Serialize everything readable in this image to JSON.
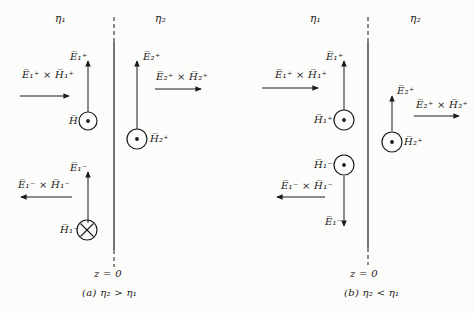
{
  "figure": {
    "background": "#fcfcfa",
    "ink": "#1a1a19"
  },
  "panel_a": {
    "region_left": "η₁",
    "region_right": "η₂",
    "boundary_label": "z = 0",
    "caption": "(a)  η₂ > η₁",
    "incident": {
      "e_label": "E̅₁⁺",
      "poynting_label": "E̅₁⁺ × H̅₁⁺",
      "h_label": "H̅",
      "h_symbol": "out-of-page",
      "e_direction": "up",
      "propagation": "right"
    },
    "reflected": {
      "e_label": "E̅₁⁻",
      "poynting_label": "E̅₁⁻ × H̅₁⁻",
      "h_label": "H̅₁⁻",
      "h_symbol": "into-page",
      "e_direction": "up",
      "propagation": "left"
    },
    "transmitted": {
      "e_label": "E̅₂⁺",
      "poynting_label": "E̅₂⁺ × H̅₂⁺",
      "h_label": "H̅₂⁺",
      "h_symbol": "out-of-page",
      "e_direction": "up",
      "propagation": "right"
    }
  },
  "panel_b": {
    "region_left": "η₁",
    "region_right": "η₂",
    "boundary_label": "z = 0",
    "caption": "(b)  η₂ < η₁",
    "incident": {
      "e_label": "E̅₁⁺",
      "poynting_label": "E̅₁⁺ × H̅₁⁺",
      "h_label": "H̅₁⁺",
      "h_symbol": "out-of-page",
      "e_direction": "up",
      "propagation": "right"
    },
    "reflected": {
      "e_label": "E̅₁⁻",
      "poynting_label": "E̅₁⁻ × H̅₁⁻",
      "h_label": "H̅₁⁻",
      "h_symbol": "out-of-page",
      "e_direction": "down",
      "propagation": "left"
    },
    "transmitted": {
      "e_label": "E̅₂⁺",
      "poynting_label": "E̅₂⁺ × H̅₂⁺",
      "h_label": "H̅₂⁺",
      "h_symbol": "out-of-page",
      "e_direction": "up",
      "propagation": "right"
    }
  }
}
